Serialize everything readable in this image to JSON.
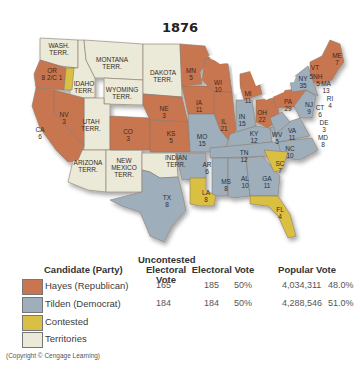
{
  "title": "1876",
  "colors": {
    "republican": "#c87650",
    "democrat": "#9eaebb",
    "contested": "#d9bf43",
    "territories": "#ebe9d7",
    "water": "#ffffff"
  },
  "map": {
    "states": [
      {
        "abbr": "WASH. TERR.",
        "ev": "",
        "party": "territory"
      },
      {
        "abbr": "OR",
        "ev": "8 2/C 1",
        "party": "republican"
      },
      {
        "abbr": "CA",
        "ev": "6",
        "party": "republican"
      },
      {
        "abbr": "NV",
        "ev": "3",
        "party": "republican"
      },
      {
        "abbr": "IDAHO TERR.",
        "ev": "",
        "party": "territory"
      },
      {
        "abbr": "MONTANA TERR.",
        "ev": "",
        "party": "territory"
      },
      {
        "abbr": "WYOMING TERR.",
        "ev": "",
        "party": "territory"
      },
      {
        "abbr": "UTAH TERR.",
        "ev": "",
        "party": "territory"
      },
      {
        "abbr": "ARIZONA TERR.",
        "ev": "",
        "party": "territory"
      },
      {
        "abbr": "NEW MEXICO TERR.",
        "ev": "",
        "party": "territory"
      },
      {
        "abbr": "DAKOTA TERR.",
        "ev": "",
        "party": "territory"
      },
      {
        "abbr": "CO",
        "ev": "3",
        "party": "republican"
      },
      {
        "abbr": "NE",
        "ev": "3",
        "party": "republican"
      },
      {
        "abbr": "KS",
        "ev": "5",
        "party": "republican"
      },
      {
        "abbr": "INDIAN TERR.",
        "ev": "",
        "party": "territory"
      },
      {
        "abbr": "TX",
        "ev": "8",
        "party": "democrat"
      },
      {
        "abbr": "MN",
        "ev": "5",
        "party": "republican"
      },
      {
        "abbr": "IA",
        "ev": "11",
        "party": "republican"
      },
      {
        "abbr": "MO",
        "ev": "15",
        "party": "democrat"
      },
      {
        "abbr": "AR",
        "ev": "6",
        "party": "democrat"
      },
      {
        "abbr": "LA",
        "ev": "8",
        "party": "contested"
      },
      {
        "abbr": "WI",
        "ev": "10",
        "party": "republican"
      },
      {
        "abbr": "IL",
        "ev": "21",
        "party": "republican"
      },
      {
        "abbr": "MI",
        "ev": "11",
        "party": "republican"
      },
      {
        "abbr": "IN",
        "ev": "15",
        "party": "democrat"
      },
      {
        "abbr": "OH",
        "ev": "22",
        "party": "republican"
      },
      {
        "abbr": "KY",
        "ev": "12",
        "party": "democrat"
      },
      {
        "abbr": "TN",
        "ev": "12",
        "party": "democrat"
      },
      {
        "abbr": "MS",
        "ev": "8",
        "party": "democrat"
      },
      {
        "abbr": "AL",
        "ev": "10",
        "party": "democrat"
      },
      {
        "abbr": "GA",
        "ev": "11",
        "party": "democrat"
      },
      {
        "abbr": "FL",
        "ev": "4",
        "party": "contested"
      },
      {
        "abbr": "SC",
        "ev": "7",
        "party": "contested"
      },
      {
        "abbr": "NC",
        "ev": "10",
        "party": "democrat"
      },
      {
        "abbr": "VA",
        "ev": "11",
        "party": "democrat"
      },
      {
        "abbr": "WV",
        "ev": "5",
        "party": "democrat"
      },
      {
        "abbr": "PA",
        "ev": "29",
        "party": "republican"
      },
      {
        "abbr": "NY",
        "ev": "35",
        "party": "democrat"
      },
      {
        "abbr": "NJ",
        "ev": "9",
        "party": "democrat"
      },
      {
        "abbr": "DE",
        "ev": "3",
        "party": "democrat"
      },
      {
        "abbr": "MD",
        "ev": "8",
        "party": "democrat"
      },
      {
        "abbr": "CT",
        "ev": "6",
        "party": "democrat"
      },
      {
        "abbr": "RI",
        "ev": "4",
        "party": "republican"
      },
      {
        "abbr": "MA",
        "ev": "13",
        "party": "republican"
      },
      {
        "abbr": "VT",
        "ev": "5",
        "party": "republican"
      },
      {
        "abbr": "NH",
        "ev": "5",
        "party": "republican"
      },
      {
        "abbr": "ME",
        "ev": "7",
        "party": "republican"
      }
    ]
  },
  "legend": {
    "headers": {
      "candidate": "Candidate (Party)",
      "uncontested": "Uncontested Electoral Vote",
      "electoral": "Electoral Vote",
      "popular": "Popular Vote"
    },
    "rows": [
      {
        "label": "Hayes (Republican)",
        "uncontested": "165",
        "electoral": "185",
        "electoral_pct": "50%",
        "popular": "4,034,311",
        "popular_pct": "48.0%"
      },
      {
        "label": "Tilden (Democrat)",
        "uncontested": "184",
        "electoral": "184",
        "electoral_pct": "50%",
        "popular": "4,288,546",
        "popular_pct": "51.0%"
      },
      {
        "label": "Contested"
      },
      {
        "label": "Territories"
      }
    ]
  },
  "copyright": "(Copyright © Cengage Learning)"
}
